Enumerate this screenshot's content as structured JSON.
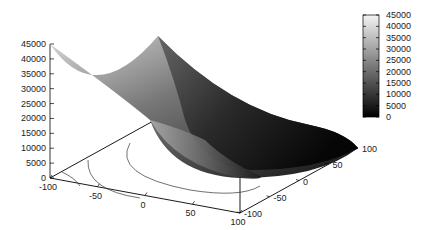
{
  "chart_data": {
    "type": "surface3d",
    "title": "",
    "xlabel": "",
    "ylabel": "",
    "zlabel": "",
    "x_ticks": [
      -100,
      -50,
      0,
      50,
      100
    ],
    "y_ticks": [
      -100,
      -50,
      0,
      50,
      100
    ],
    "z_ticks": [
      0,
      5000,
      10000,
      15000,
      20000,
      25000,
      30000,
      35000,
      40000,
      45000
    ],
    "xlim": [
      -100,
      100
    ],
    "ylim": [
      -100,
      100
    ],
    "zlim": [
      0,
      45000
    ],
    "colorbar": {
      "ticks": [
        0,
        5000,
        10000,
        15000,
        20000,
        25000,
        30000,
        35000,
        40000,
        45000
      ],
      "range": [
        0,
        45000
      ],
      "palette": "grayscale",
      "low_color": "#000000",
      "high_color": "#ffffff"
    },
    "surface": "paraboloid z ≈ x^2 + y^2 (pm3d grayscale)",
    "contours_on_base": true,
    "legend_position": "right"
  },
  "labels": {
    "z": [
      "45000",
      "40000",
      "35000",
      "30000",
      "25000",
      "20000",
      "15000",
      "10000",
      "5000",
      "0"
    ],
    "x": [
      "-100",
      "-50",
      "0",
      "50",
      "100"
    ],
    "y": [
      "-100",
      "-50",
      "0",
      "50",
      "100"
    ],
    "cb": [
      "45000",
      "40000",
      "35000",
      "30000",
      "25000",
      "20000",
      "15000",
      "10000",
      "5000",
      "0"
    ]
  }
}
